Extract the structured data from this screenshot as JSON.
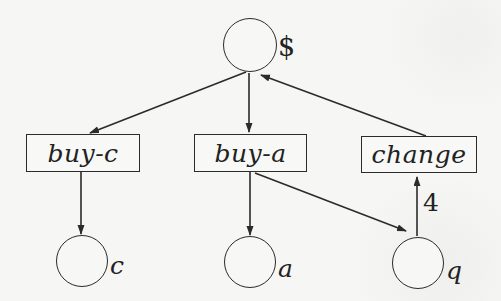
{
  "diagram": {
    "type": "petri-net",
    "colors": {
      "ink": "#2b2b2b",
      "paper": "#f6f6f4"
    },
    "places": [
      {
        "id": "dollar",
        "label": "$"
      },
      {
        "id": "c",
        "label": "c"
      },
      {
        "id": "a",
        "label": "a"
      },
      {
        "id": "q",
        "label": "q"
      }
    ],
    "transitions": [
      {
        "id": "buy-c",
        "label": "buy-c"
      },
      {
        "id": "buy-a",
        "label": "buy-a"
      },
      {
        "id": "change",
        "label": "change"
      }
    ],
    "edges": [
      {
        "from": "dollar",
        "to": "buy-c"
      },
      {
        "from": "dollar",
        "to": "buy-a"
      },
      {
        "from": "change",
        "to": "dollar"
      },
      {
        "from": "buy-c",
        "to": "c"
      },
      {
        "from": "buy-a",
        "to": "a"
      },
      {
        "from": "buy-a",
        "to": "q"
      },
      {
        "from": "q",
        "to": "change",
        "weight": "4"
      }
    ]
  }
}
